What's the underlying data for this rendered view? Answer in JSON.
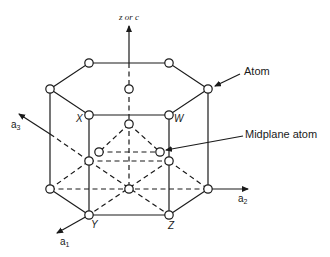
{
  "diagram": {
    "axes": {
      "z": {
        "label": "z or c"
      },
      "a1": {
        "label": "a",
        "sub": "1"
      },
      "a2": {
        "label": "a",
        "sub": "2"
      },
      "a3": {
        "label": "a",
        "sub": "3"
      }
    },
    "vertex_labels": {
      "X": "X",
      "W": "W",
      "Y": "Y",
      "Z": "Z"
    },
    "callouts": {
      "atom": "Atom",
      "midplane_atom": "Midplane atom"
    },
    "colors": {
      "line": "#1a1a1a",
      "atom_fill": "#ffffff",
      "background": "#ffffff"
    }
  }
}
